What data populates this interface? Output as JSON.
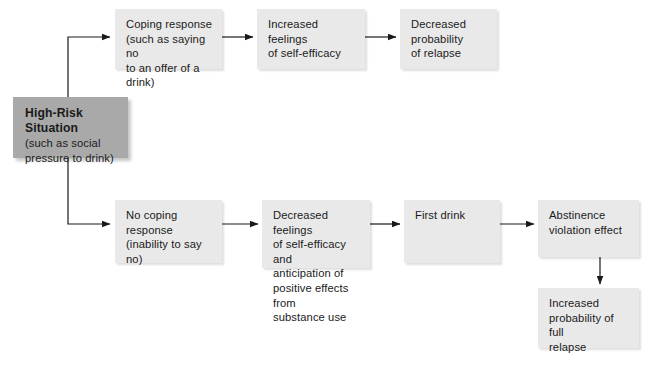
{
  "diagram": {
    "colors": {
      "background": "#ffffff",
      "node_fill": "#e9e9e9",
      "start_node_fill": "#a9a9a9",
      "text": "#1a1a1a",
      "edge": "#1a1a1a"
    },
    "nodes": [
      {
        "id": "high-risk-situation",
        "title": "High-Risk\nSituation",
        "subtitle": "(such as social\npressure to drink)",
        "x": 13,
        "y": 97,
        "w": 115,
        "h": 61
      },
      {
        "id": "coping-response",
        "body": "Coping response\n(such as saying no\nto an offer of a\ndrink)",
        "x": 115,
        "y": 9,
        "w": 107,
        "h": 60
      },
      {
        "id": "increased-self-efficacy",
        "body": "Increased feelings\nof self-efficacy",
        "x": 257,
        "y": 9,
        "w": 108,
        "h": 60
      },
      {
        "id": "decreased-probability-relapse",
        "body": "Decreased\nprobability\nof relapse",
        "x": 400,
        "y": 9,
        "w": 97,
        "h": 60
      },
      {
        "id": "no-coping-response",
        "body": "No coping response\n(inability to say no)",
        "x": 115,
        "y": 200,
        "w": 107,
        "h": 63
      },
      {
        "id": "decreased-self-efficacy",
        "body": "Decreased feelings\nof self-efficacy and\nanticipation of\npositive effects from\nsubstance use",
        "x": 262,
        "y": 200,
        "w": 108,
        "h": 68
      },
      {
        "id": "first-drink",
        "body": "First drink",
        "x": 404,
        "y": 200,
        "w": 96,
        "h": 63
      },
      {
        "id": "abstinence-violation-effect",
        "body": "Abstinence\nviolation effect",
        "x": 538,
        "y": 200,
        "w": 101,
        "h": 57
      },
      {
        "id": "increased-probability-full-relapse",
        "body": "Increased\nprobability of full\nrelapse",
        "x": 538,
        "y": 288,
        "w": 101,
        "h": 60
      }
    ],
    "edges": [
      {
        "id": "edge-start-to-coping",
        "kind": "elbow-up",
        "label": ""
      },
      {
        "id": "edge-start-to-no-coping",
        "kind": "elbow-down",
        "label": ""
      },
      {
        "id": "edge-coping-to-self-efficacy",
        "kind": "straight-right",
        "label": ""
      },
      {
        "id": "edge-self-efficacy-to-decreased-relapse",
        "kind": "straight-right",
        "label": ""
      },
      {
        "id": "edge-no-coping-to-decreased-self-efficacy",
        "kind": "straight-right",
        "label": ""
      },
      {
        "id": "edge-decreased-self-efficacy-to-first-drink",
        "kind": "straight-right",
        "label": ""
      },
      {
        "id": "edge-first-drink-to-ave",
        "kind": "straight-right",
        "label": ""
      },
      {
        "id": "edge-ave-to-full-relapse",
        "kind": "straight-down",
        "label": ""
      }
    ]
  }
}
